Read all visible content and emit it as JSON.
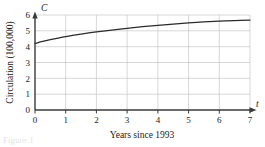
{
  "figure": {
    "caption_fragment": "Figure 1"
  },
  "chart_data": {
    "type": "line",
    "title": "",
    "xlabel": "Years since 1993",
    "ylabel": "Circulation (100,000)",
    "x_axis_symbol": "t",
    "y_axis_symbol": "C",
    "xlim": [
      0,
      7
    ],
    "ylim": [
      0,
      6
    ],
    "xticks": [
      0,
      1,
      2,
      3,
      4,
      5,
      6,
      7
    ],
    "yticks": [
      0,
      1,
      2,
      3,
      4,
      5,
      6
    ],
    "xtick_labels": [
      "0",
      "1",
      "2",
      "3",
      "4",
      "5",
      "6",
      "7"
    ],
    "ytick_labels": [
      "0",
      "1",
      "2",
      "3",
      "4",
      "5",
      "6"
    ],
    "grid": true,
    "legend": "none",
    "series": [
      {
        "name": "Circulation",
        "color": "#2b2b2b",
        "x": [
          0,
          0.25,
          0.5,
          0.75,
          1,
          1.5,
          2,
          2.5,
          3,
          3.5,
          4,
          4.5,
          5,
          5.5,
          6,
          6.5,
          7
        ],
        "values": [
          4.2,
          4.33,
          4.44,
          4.54,
          4.63,
          4.79,
          4.93,
          5.05,
          5.16,
          5.26,
          5.35,
          5.43,
          5.5,
          5.56,
          5.61,
          5.65,
          5.68
        ]
      }
    ]
  }
}
